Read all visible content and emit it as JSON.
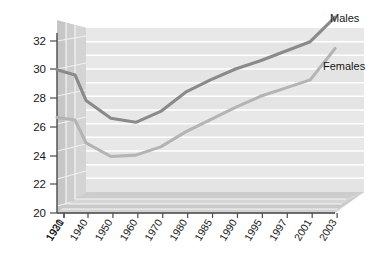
{
  "chart_data": {
    "type": "line",
    "title": "",
    "subtitle": "",
    "xlabel": "",
    "ylabel": "",
    "ylim": [
      20,
      32
    ],
    "ytick_step": 2,
    "yticks": [
      20,
      22,
      24,
      26,
      28,
      30,
      32
    ],
    "grid": true,
    "grid_orientation": "horizontal",
    "legend_position": "inline-right-of-line-ends",
    "style": "3d-perspective-line-chart",
    "categories": [
      "1921",
      "1930",
      "1940",
      "1950",
      "1960",
      "1970",
      "1980",
      "1985",
      "1990",
      "1995",
      "1997",
      "2001",
      "2003"
    ],
    "series": [
      {
        "name": "Males",
        "color": "#8a8a8a",
        "values": [
          28.0,
          28.2,
          26.7,
          25.4,
          25.1,
          25.9,
          27.3,
          28.2,
          29.0,
          29.6,
          30.3,
          31.0,
          32.8
        ]
      },
      {
        "name": "Females",
        "color": "#b4b4b4",
        "values": [
          24.5,
          24.9,
          23.6,
          22.6,
          22.7,
          23.3,
          24.4,
          25.3,
          26.2,
          27.0,
          27.6,
          28.2,
          30.5
        ]
      }
    ]
  },
  "axes": {
    "y_tick_labels": [
      "32",
      "30",
      "28",
      "26",
      "24",
      "22",
      "20"
    ],
    "x_tick_labels": [
      "1921",
      "1930",
      "1940",
      "1950",
      "1960",
      "1970",
      "1980",
      "1985",
      "1990",
      "1995",
      "1997",
      "2001",
      "2003"
    ]
  },
  "legend": {
    "males_label": "Males",
    "females_label": "Females"
  },
  "colors": {
    "males_line": "#8a8a8a",
    "females_line": "#b4b4b4",
    "plot_background": "#e6e6e6",
    "plot_band": "#dcdcdc",
    "gridline": "#ffffff",
    "wall_side": "#c9c9c9",
    "floor": "#cfcfcf",
    "axis": "#4a4a4a",
    "text": "#161616"
  }
}
